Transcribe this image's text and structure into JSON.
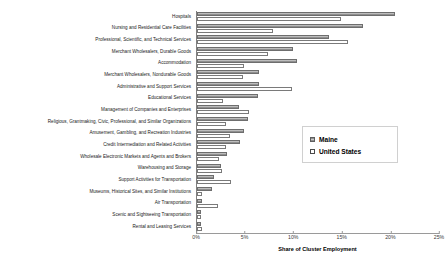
{
  "chart_data": {
    "type": "bar",
    "orientation": "horizontal",
    "title": "",
    "xlabel": "Share of Cluster Employment",
    "ylabel": "",
    "xlim": [
      0,
      25
    ],
    "xtick_labels": [
      "0%",
      "5%",
      "10%",
      "15%",
      "20%",
      "25%"
    ],
    "xtick_values": [
      0,
      5,
      10,
      15,
      20,
      25
    ],
    "grid": false,
    "legend_position": "center-right",
    "categories": [
      "Hospitals",
      "Nursing and Residential Care Facilities",
      "Professional, Scientific, and Technical Services",
      "Merchant Wholesalers, Durable Goods",
      "Accommodation",
      "Merchant Wholesalers, Nondurable Goods",
      "Administrative and Support Services",
      "Educational Services",
      "Management of Companies and Enterprises",
      "Religious, Grantmaking, Civic, Professional, and Similar Organizations",
      "Amusement, Gambling, and Recreation Industries",
      "Credit Intermediation and Related Activities",
      "Wholesale Electronic Markets and Agents and Brokers",
      "Warehousing and Storage",
      "Support Activities for Transportation",
      "Museums, Historical Sites, and Similar Institutions",
      "Air Transportation",
      "Scenic and Sightseeing Transportation",
      "Rental and Leasing Services"
    ],
    "series": [
      {
        "name": "Maine",
        "color": "#a6a6a6",
        "values": [
          20.5,
          17.2,
          13.6,
          9.9,
          10.3,
          6.4,
          6.4,
          6.3,
          4.3,
          5.3,
          4.9,
          4.4,
          3.1,
          2.5,
          1.8,
          1.5,
          0.5,
          0.4,
          0.4
        ]
      },
      {
        "name": "United States",
        "color": "#ffffff",
        "values": [
          14.9,
          7.8,
          15.6,
          7.3,
          4.9,
          4.8,
          9.8,
          2.7,
          5.4,
          3.0,
          3.4,
          3.0,
          2.3,
          2.6,
          3.5,
          0.5,
          2.2,
          0.2,
          0.5
        ]
      }
    ]
  },
  "legend": {
    "items": [
      {
        "label": "Maine"
      },
      {
        "label": "United States"
      }
    ]
  }
}
